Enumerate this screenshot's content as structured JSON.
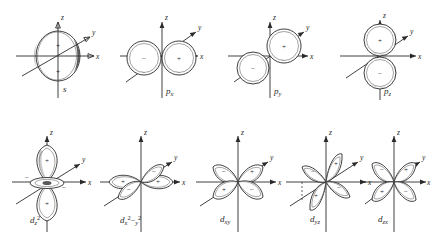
{
  "figure": {
    "background_color": "#ffffff",
    "ink_color": "#1c1c1c",
    "axis_labels": {
      "x": "x",
      "y": "y",
      "z": "z"
    },
    "sign_positive": "+",
    "sign_negative": "−",
    "rows": [
      {
        "name": "row-s-p",
        "orbitals": [
          {
            "key": "s",
            "label_main": "s",
            "label_sub": "",
            "label_sup": "",
            "type": "sphere",
            "lobes": [
              {
                "sign": "+",
                "direction": "upper"
              },
              {
                "sign": "+",
                "direction": "lower"
              }
            ]
          },
          {
            "key": "px",
            "label_main": "p",
            "label_sub": "x",
            "label_sup": "",
            "type": "dumbbell-x",
            "lobes": [
              {
                "sign": "−",
                "direction": "-x"
              },
              {
                "sign": "+",
                "direction": "+x"
              }
            ]
          },
          {
            "key": "py",
            "label_main": "p",
            "label_sub": "y",
            "label_sup": "",
            "type": "dumbbell-y",
            "lobes": [
              {
                "sign": "−",
                "direction": "-y"
              },
              {
                "sign": "+",
                "direction": "+y"
              }
            ]
          },
          {
            "key": "pz",
            "label_main": "p",
            "label_sub": "z",
            "label_sup": "",
            "type": "dumbbell-z",
            "lobes": [
              {
                "sign": "+",
                "direction": "+z"
              },
              {
                "sign": "−",
                "direction": "-z"
              }
            ]
          }
        ]
      },
      {
        "name": "row-d",
        "orbitals": [
          {
            "key": "dz2",
            "label_main": "d",
            "label_sub": "z",
            "label_sup": "2",
            "type": "dz2",
            "lobes": [
              {
                "sign": "+",
                "direction": "+z"
              },
              {
                "sign": "+",
                "direction": "-z"
              },
              {
                "sign": "−",
                "direction": "torus-left"
              },
              {
                "sign": "−",
                "direction": "torus-right"
              }
            ]
          },
          {
            "key": "dx2y2",
            "label_main": "d",
            "label_sub": "x",
            "label_sup": "2",
            "label_sub2": "y",
            "label_sup2": "2",
            "label_op": "−",
            "type": "cloverleaf-xy-axes",
            "lobes": [
              {
                "sign": "+",
                "direction": "+x"
              },
              {
                "sign": "+",
                "direction": "-x"
              },
              {
                "sign": "−",
                "direction": "+y"
              },
              {
                "sign": "−",
                "direction": "-y"
              }
            ]
          },
          {
            "key": "dxy",
            "label_main": "d",
            "label_sub": "xy",
            "label_sup": "",
            "type": "cloverleaf-xy-diagonal",
            "lobes": [
              {
                "sign": "+",
                "direction": "upper-right"
              },
              {
                "sign": "−",
                "direction": "upper-left"
              },
              {
                "sign": "+",
                "direction": "lower-left"
              },
              {
                "sign": "−",
                "direction": "lower-right"
              }
            ]
          },
          {
            "key": "dyz",
            "label_main": "d",
            "label_sub": "yz",
            "label_sup": "",
            "type": "cloverleaf-yz",
            "lobes": [
              {
                "sign": "+",
                "direction": "upper-right"
              },
              {
                "sign": "−",
                "direction": "upper-left"
              },
              {
                "sign": "+",
                "direction": "lower-left"
              },
              {
                "sign": "−",
                "direction": "lower-right"
              }
            ]
          },
          {
            "key": "dzx",
            "label_main": "d",
            "label_sub": "zx",
            "label_sup": "",
            "type": "cloverleaf-zx",
            "lobes": [
              {
                "sign": "+",
                "direction": "upper-right"
              },
              {
                "sign": "−",
                "direction": "upper-left"
              },
              {
                "sign": "+",
                "direction": "lower-left"
              },
              {
                "sign": "−",
                "direction": "lower-right"
              }
            ]
          }
        ]
      }
    ]
  }
}
